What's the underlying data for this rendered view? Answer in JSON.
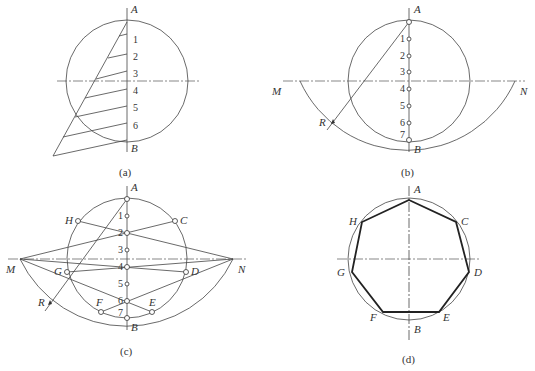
{
  "figure": {
    "panels": [
      {
        "id": "a",
        "caption": "(a)",
        "labels": {
          "top": "A",
          "bottom": "B"
        },
        "divisions": [
          "1",
          "2",
          "3",
          "4",
          "5",
          "6"
        ]
      },
      {
        "id": "b",
        "caption": "(b)",
        "labels": {
          "top": "A",
          "bottom": "B",
          "left": "M",
          "right": "N",
          "radius": "R"
        },
        "divisions": [
          "1",
          "2",
          "3",
          "4",
          "5",
          "6",
          "7"
        ]
      },
      {
        "id": "c",
        "caption": "(c)",
        "labels": {
          "top": "A",
          "bottom": "B",
          "left": "M",
          "right": "N",
          "radius": "R",
          "H": "H",
          "C": "C",
          "G": "G",
          "D": "D",
          "F": "F",
          "E": "E"
        },
        "divisions": [
          "1",
          "2",
          "3",
          "4",
          "5",
          "6",
          "7"
        ]
      },
      {
        "id": "d",
        "caption": "(d)",
        "labels": {
          "A": "A",
          "B": "B",
          "C": "C",
          "D": "D",
          "E": "E",
          "F": "F",
          "G": "G",
          "H": "H"
        }
      }
    ]
  },
  "colors": {
    "line": "#444444",
    "background": "#ffffff"
  }
}
